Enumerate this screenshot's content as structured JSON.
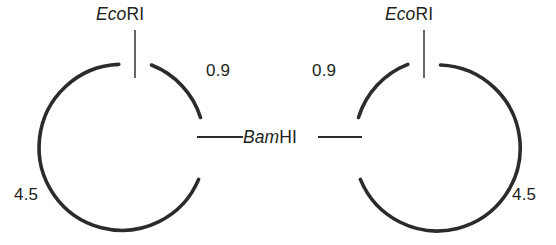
{
  "figure": {
    "type": "plasmid-restriction-map-diagram",
    "stroke_color": "#2b2b2b",
    "text_color": "#231f20",
    "background_color": "#ffffff"
  },
  "plasmids": [
    {
      "id": "left-plasmid",
      "sites": [
        {
          "name_genus": "Eco",
          "name_suffix": "RI",
          "position": "top"
        },
        {
          "name_genus": "Bam",
          "name_suffix": "HI",
          "position": "right"
        }
      ],
      "fragments": [
        {
          "size": "0.9",
          "position": "upper-right"
        },
        {
          "size": "4.5",
          "position": "lower-left"
        }
      ]
    },
    {
      "id": "right-plasmid",
      "sites": [
        {
          "name_genus": "Eco",
          "name_suffix": "RI",
          "position": "top"
        },
        {
          "name_genus": "Bam",
          "name_suffix": "HI",
          "position": "left"
        }
      ],
      "fragments": [
        {
          "size": "0.9",
          "position": "upper-left"
        },
        {
          "size": "4.5",
          "position": "lower-right"
        }
      ]
    }
  ],
  "labels": {
    "eco_left": {
      "genus": "Eco",
      "suffix": "RI"
    },
    "eco_right": {
      "genus": "Eco",
      "suffix": "RI"
    },
    "bam_center": {
      "genus": "Bam",
      "suffix": "HI"
    },
    "left_small_fragment": "0.9",
    "left_large_fragment": "4.5",
    "right_small_fragment": "0.9",
    "right_large_fragment": "4.5"
  }
}
